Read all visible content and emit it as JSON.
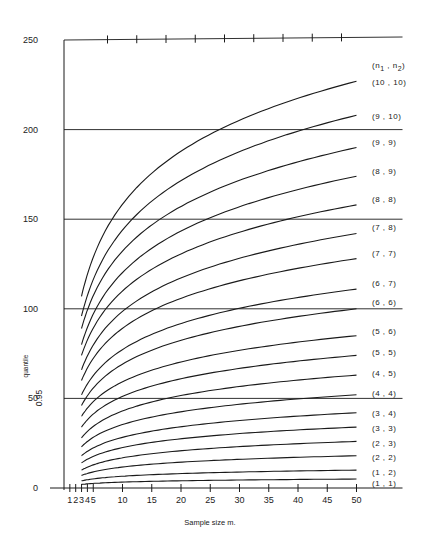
{
  "chart_data": {
    "type": "line",
    "title": "",
    "xlabel": "Sample size m.",
    "ylabel_prefix": "0.95",
    "ylabel": "quantile",
    "xlim": [
      0,
      50
    ],
    "ylim": [
      0,
      250
    ],
    "x_ticks": [
      1,
      2,
      3,
      4,
      5,
      10,
      15,
      20,
      25,
      30,
      35,
      40,
      45,
      50
    ],
    "x_tick_labels": [
      "1",
      "2",
      "3",
      "4",
      "5",
      "10",
      "15",
      "20",
      "25",
      "30",
      "35",
      "40",
      "45",
      "50"
    ],
    "y_ticks": [
      0,
      50,
      100,
      150,
      200,
      250
    ],
    "y_tick_labels": [
      "0",
      "50",
      "100",
      "150",
      "200",
      "250"
    ],
    "gridlines_y": [
      50,
      100,
      150,
      200,
      250
    ],
    "legend_header": "(n1 , n2)",
    "x": [
      3,
      50
    ],
    "series": [
      {
        "name": "(10 , 10)",
        "start": 107,
        "end": 227
      },
      {
        "name": "(9 , 10)",
        "start": 96,
        "end": 208
      },
      {
        "name": "(9 , 9)",
        "start": 89,
        "end": 190
      },
      {
        "name": "(8 , 9)",
        "start": 80,
        "end": 174
      },
      {
        "name": "(8 , 8)",
        "start": 74,
        "end": 158
      },
      {
        "name": "(7 , 8)",
        "start": 66,
        "end": 142
      },
      {
        "name": "(7 , 7)",
        "start": 60,
        "end": 128
      },
      {
        "name": "(6 , 7)",
        "start": 52,
        "end": 111
      },
      {
        "name": "(6 , 6)",
        "start": 46,
        "end": 100
      },
      {
        "name": "(5 , 6)",
        "start": 40,
        "end": 85
      },
      {
        "name": "(5 , 5)",
        "start": 34,
        "end": 74
      },
      {
        "name": "(4 , 5)",
        "start": 28,
        "end": 63
      },
      {
        "name": "(4 , 4)",
        "start": 23,
        "end": 52
      },
      {
        "name": "(3 , 4)",
        "start": 18,
        "end": 42
      },
      {
        "name": "(3 , 3)",
        "start": 14,
        "end": 34
      },
      {
        "name": "(2 , 3)",
        "start": 10,
        "end": 26
      },
      {
        "name": "(2 , 2)",
        "start": 7,
        "end": 18
      },
      {
        "name": "(1 , 2)",
        "start": 4,
        "end": 10
      },
      {
        "name": "(1 , 1)",
        "start": 2,
        "end": 5
      }
    ],
    "label_y_px": [
      102,
      136,
      162,
      191,
      219,
      247,
      273,
      303,
      322,
      351,
      372,
      393,
      413,
      433,
      448,
      463,
      477,
      492,
      503
    ],
    "grid": true,
    "legend_position": "right"
  }
}
